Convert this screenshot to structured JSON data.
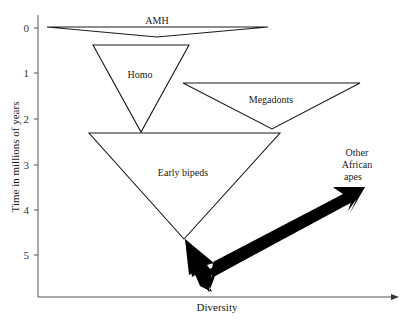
{
  "diagram": {
    "y_axis": {
      "label": "Time in millions of years",
      "ticks": [
        "0",
        "1",
        "2",
        "3",
        "4",
        "5"
      ]
    },
    "x_axis": {
      "label": "Diversity"
    },
    "groups": [
      {
        "id": "amh",
        "label": "AMH"
      },
      {
        "id": "homo",
        "label": "Homo"
      },
      {
        "id": "megadonts",
        "label": "Megadonts"
      },
      {
        "id": "early-bipeds",
        "label": "Early bipeds"
      }
    ],
    "outgroup": {
      "label_line1": "Other",
      "label_line2": "African",
      "label_line3": "apes"
    },
    "colors": {
      "line": "#1a1a1a",
      "axis": "#555555",
      "arrow": "#000000",
      "background": "#ffffff"
    }
  }
}
